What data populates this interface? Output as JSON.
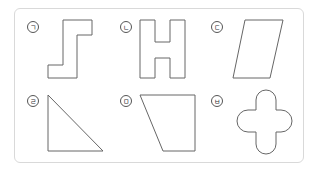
{
  "figure": {
    "labels": [
      "ㄱ",
      "ㄴ",
      "ㄷ",
      "ㄹ",
      "ㅁ",
      "ㅂ"
    ],
    "shapes": [
      {
        "label": "ㄱ",
        "name": "z-shape"
      },
      {
        "label": "ㄴ",
        "name": "h-shape"
      },
      {
        "label": "ㄷ",
        "name": "parallelogram"
      },
      {
        "label": "ㄹ",
        "name": "right-triangle"
      },
      {
        "label": "ㅁ",
        "name": "trapezoid"
      },
      {
        "label": "ㅂ",
        "name": "rounded-cross"
      }
    ],
    "stroke_color": "#666666",
    "border_color": "#d9d9d9"
  }
}
